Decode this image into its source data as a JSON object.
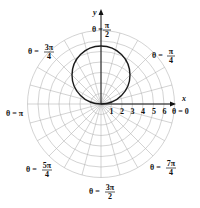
{
  "chart_data": {
    "type": "line",
    "subtype": "polar",
    "title": "",
    "curve": {
      "equation": "r = 6 sin θ",
      "description": "circle through origin, centered on positive y-axis, diameter 6"
    },
    "xlabel": "x",
    "ylabel": "y",
    "r_ticks": [
      "1",
      "2",
      "3",
      "4",
      "5",
      "6"
    ],
    "r_max_grid": 7,
    "grid": true,
    "angle_labels": [
      {
        "id": "a0",
        "text": "θ = 0"
      },
      {
        "id": "a45",
        "num": "π",
        "den": "4",
        "prefix": "θ ="
      },
      {
        "id": "a90",
        "num": "π",
        "den": "2",
        "prefix": "θ ="
      },
      {
        "id": "a135",
        "num": "3π",
        "den": "4",
        "prefix": "θ ="
      },
      {
        "id": "a180",
        "text": "θ = π"
      },
      {
        "id": "a225",
        "num": "5π",
        "den": "4",
        "prefix": "θ ="
      },
      {
        "id": "a270",
        "num": "3π",
        "den": "2",
        "prefix": "θ ="
      },
      {
        "id": "a315",
        "num": "7π",
        "den": "4",
        "prefix": "θ ="
      }
    ],
    "colors": {
      "grid": "#b5b5b5",
      "curve": "#1a1a1a",
      "axis": "#111111"
    }
  }
}
